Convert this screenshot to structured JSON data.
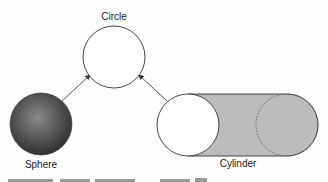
{
  "diagram": {
    "nodes": [
      {
        "id": "circle",
        "label": "Circle",
        "shape": "circle",
        "fill": "#ffffff"
      },
      {
        "id": "sphere",
        "label": "Sphere",
        "shape": "shaded-sphere",
        "fill": "#4a4a4a"
      },
      {
        "id": "cylinder",
        "label": "Cylinder",
        "shape": "cylinder",
        "fill": "#bdbdbd"
      }
    ],
    "edges": [
      {
        "from": "sphere",
        "to": "circle",
        "arrow": "to"
      },
      {
        "from": "cylinder",
        "to": "circle",
        "arrow": "to"
      }
    ],
    "colors": {
      "stroke": "#333333",
      "cylinder_body": "#bcbcbc",
      "sphere_dark": "#2e2e2e",
      "sphere_light": "#8a8a8a"
    }
  }
}
